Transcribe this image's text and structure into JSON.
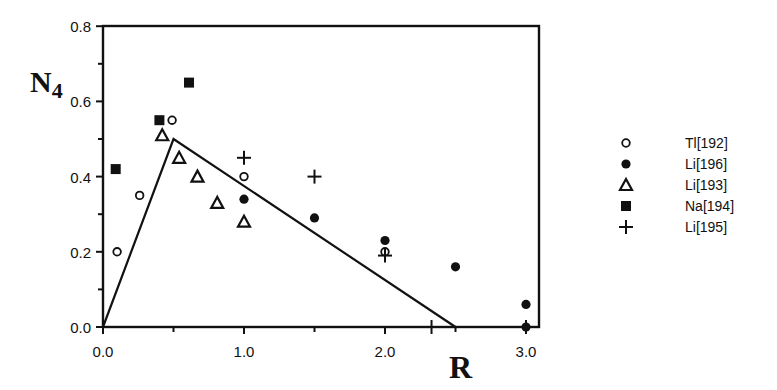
{
  "chart_data": {
    "type": "scatter",
    "title": "",
    "xlabel": "R",
    "ylabel": "N4",
    "ylabel_main": "N",
    "ylabel_sub": "4",
    "xlim": [
      0.0,
      3.1
    ],
    "ylim": [
      0.0,
      0.8
    ],
    "grid": false,
    "legend_position": "right",
    "x_ticks": [
      {
        "value": 0.0,
        "label": "0.0"
      },
      {
        "value": 1.0,
        "label": "1.0"
      },
      {
        "value": 2.0,
        "label": "2.0"
      },
      {
        "value": 3.0,
        "label": "3.0"
      }
    ],
    "x_minor_ticks": [
      0.5,
      1.5,
      2.5
    ],
    "y_ticks": [
      {
        "value": 0.0,
        "label": "0.0"
      },
      {
        "value": 0.2,
        "label": "0.2"
      },
      {
        "value": 0.4,
        "label": "0.4"
      },
      {
        "value": 0.6,
        "label": "0.6"
      },
      {
        "value": 0.8,
        "label": "0.8"
      }
    ],
    "y_minor_ticks": [
      0.1,
      0.3,
      0.5,
      0.7
    ],
    "model_line": {
      "name": "theoretical N4",
      "points": [
        [
          0.0,
          0.0
        ],
        [
          0.5,
          0.5
        ],
        [
          2.5,
          0.0
        ]
      ]
    },
    "series": [
      {
        "name": "Tl[192]",
        "marker": "open-circle",
        "points": [
          [
            0.1,
            0.2
          ],
          [
            0.26,
            0.35
          ],
          [
            0.49,
            0.55
          ],
          [
            1.0,
            0.4
          ],
          [
            2.0,
            0.2
          ]
        ]
      },
      {
        "name": "Li[196]",
        "marker": "filled-circle",
        "points": [
          [
            1.0,
            0.34
          ],
          [
            1.5,
            0.29
          ],
          [
            2.0,
            0.23
          ],
          [
            2.5,
            0.16
          ],
          [
            3.0,
            0.06
          ],
          [
            3.0,
            0.0
          ]
        ]
      },
      {
        "name": "Li[193]",
        "marker": "open-triangle",
        "points": [
          [
            0.42,
            0.51
          ],
          [
            0.54,
            0.45
          ],
          [
            0.67,
            0.4
          ],
          [
            0.81,
            0.33
          ],
          [
            1.0,
            0.28
          ]
        ]
      },
      {
        "name": "Na[194]",
        "marker": "filled-square",
        "points": [
          [
            0.09,
            0.42
          ],
          [
            0.4,
            0.55
          ],
          [
            0.61,
            0.65
          ]
        ]
      },
      {
        "name": "Li[195]",
        "marker": "plus",
        "points": [
          [
            1.0,
            0.45
          ],
          [
            1.5,
            0.4
          ],
          [
            2.0,
            0.19
          ],
          [
            2.33,
            0.0
          ],
          [
            3.0,
            0.0
          ]
        ]
      }
    ]
  }
}
